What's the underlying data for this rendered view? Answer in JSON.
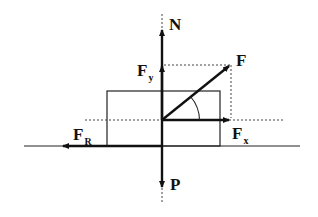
{
  "diagram": {
    "type": "free-body force diagram",
    "colors": {
      "stroke": "#111111",
      "background": "#ffffff"
    },
    "labels": {
      "N": {
        "main": "N",
        "sub": ""
      },
      "F": {
        "main": "F",
        "sub": ""
      },
      "Fy": {
        "main": "F",
        "sub": "y"
      },
      "Fx": {
        "main": "F",
        "sub": "x"
      },
      "FR": {
        "main": "F",
        "sub": "R"
      },
      "P": {
        "main": "P",
        "sub": ""
      }
    },
    "elements": [
      "ground line",
      "block (rectangle)",
      "normal force N (up)",
      "weight P (down)",
      "applied force F (angled)",
      "component Fx (horizontal)",
      "component Fy (vertical)",
      "friction force FR (left)",
      "angle arc between F and Fx"
    ]
  }
}
